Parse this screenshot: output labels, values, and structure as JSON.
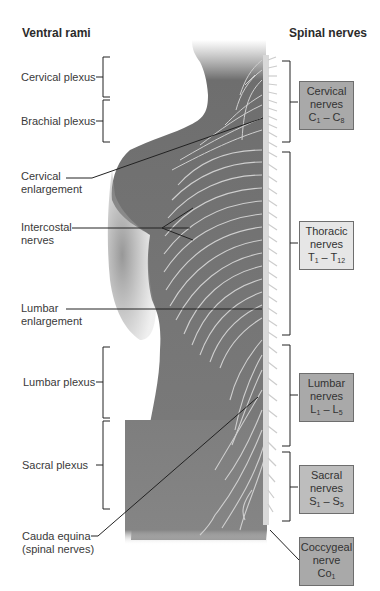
{
  "headers": {
    "left": "Ventral rami",
    "right": "Spinal nerves"
  },
  "left_labels": {
    "cervical_plexus": "Cervical plexus",
    "brachial_plexus": "Brachial plexus",
    "cervical_enlargement": [
      "Cervical",
      "enlargement"
    ],
    "intercostal_nerves": [
      "Intercostal",
      "nerves"
    ],
    "lumbar_enlargement": [
      "Lumbar",
      "enlargement"
    ],
    "lumbar_plexus": "Lumbar plexus",
    "sacral_plexus": "Sacral plexus",
    "cauda_equina": [
      "Cauda equina",
      "(spinal nerves)"
    ]
  },
  "right_boxes": [
    {
      "id": "cervical",
      "line1": "Cervical",
      "line2": "nerves",
      "range_from": "C",
      "from_sub": "1",
      "range_to": "C",
      "to_sub": "8",
      "fill": "#a9a9a9"
    },
    {
      "id": "thoracic",
      "line1": "Thoracic",
      "line2": "nerves",
      "range_from": "T",
      "from_sub": "1",
      "range_to": "T",
      "to_sub": "12",
      "fill": "#e6e6e6"
    },
    {
      "id": "lumbar",
      "line1": "Lumbar",
      "line2": "nerves",
      "range_from": "L",
      "from_sub": "1",
      "range_to": "L",
      "to_sub": "5",
      "fill": "#a9a9a9"
    },
    {
      "id": "sacral",
      "line1": "Sacral",
      "line2": "nerves",
      "range_from": "S",
      "from_sub": "1",
      "range_to": "S",
      "to_sub": "5",
      "fill": "#bdbdbd"
    },
    {
      "id": "coccygeal",
      "line1": "Coccygeal",
      "line2": "nerve",
      "range_from": "Co",
      "from_sub": "1",
      "range_to": "",
      "to_sub": "",
      "fill": "#a9a9a9"
    }
  ],
  "colors": {
    "body": "#7d7d7d",
    "nerve": "#d2d2d2",
    "leader": "#222222"
  }
}
